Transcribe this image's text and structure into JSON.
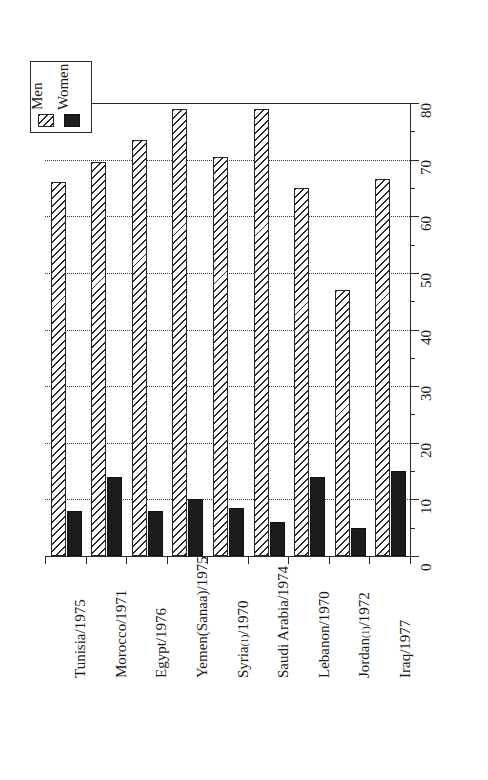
{
  "chart_data": {
    "type": "bar",
    "title": "",
    "subtitle": "",
    "xlabel": "",
    "ylabel": "",
    "ylim": [
      0,
      80
    ],
    "ytick_step": 10,
    "yminor_step": 5,
    "grid": "horizontal-dotted",
    "orientation": "vertical-bars-rotated-labels",
    "legend_position": "top-left",
    "value_axis_side": "right",
    "categories": [
      "Tunisia/1975",
      "Morocco/1971",
      "Egypt/1976",
      "Yemen(Sanaa)/1975",
      "Syria(1)/1970",
      "Saudi Arabia/1974",
      "Lebanon/1970",
      "Jordan(1)/1972",
      "Iraq/1977"
    ],
    "tick_labels": [
      "0",
      "10",
      "20",
      "30",
      "40",
      "50",
      "60",
      "70",
      "80"
    ],
    "series": [
      {
        "name": "Men",
        "pattern": "diagonal-hatch",
        "color": "#ffffff",
        "values": [
          66,
          69.5,
          73.5,
          79,
          70.5,
          79,
          65,
          47,
          66.5
        ]
      },
      {
        "name": "Women",
        "pattern": "solid",
        "color": "#1c1c1c",
        "values": [
          8,
          14,
          8,
          10,
          8.5,
          6,
          14,
          5,
          15
        ]
      }
    ]
  },
  "legend": {
    "entries": [
      {
        "label": "Men"
      },
      {
        "label": "Women"
      }
    ]
  }
}
